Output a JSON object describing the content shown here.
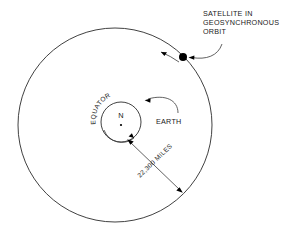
{
  "diagram": {
    "title_label": "SATELLITE IN GEOSYNCHRONOUS ORBIT",
    "background_color": "#ffffff",
    "line_color": "#2b2b2b",
    "labels": {
      "satellite_line1": "SATELLITE IN",
      "satellite_line2": "GEOSYNCHRONOUS",
      "satellite_line3": "ORBIT",
      "earth": "EARTH",
      "equator": "EQUATOR",
      "north_pole": "N",
      "distance": "22,300 MILES"
    },
    "geometry": {
      "orbit_center_x": 115,
      "orbit_center_y": 125,
      "orbit_radius": 97,
      "earth_center_x": 121,
      "earth_center_y": 122,
      "earth_radius": 20,
      "satellite_x": 183,
      "satellite_y": 57,
      "satellite_dot_radius": 4
    }
  }
}
